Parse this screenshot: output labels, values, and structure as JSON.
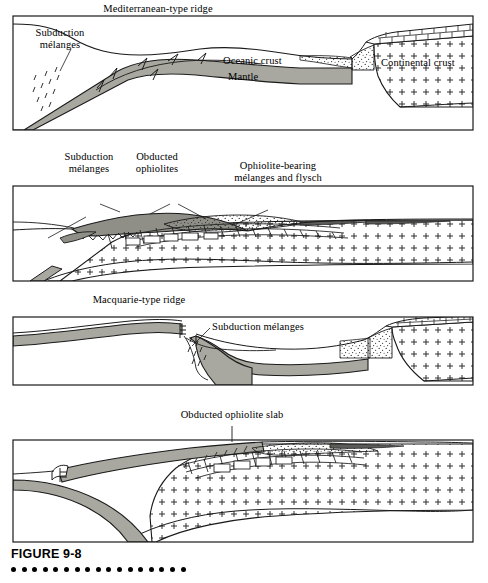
{
  "figure": {
    "caption": "FIGURE 9-8",
    "dot_count": 17,
    "dot_color": "#000000"
  },
  "colors": {
    "outline": "#1a1a1a",
    "oceanic_crust_fill": "#a8a8a0",
    "melange_fill": "#8f8f88",
    "flysch_fill": "#e8e8e2",
    "continental_fill": "#ffffff",
    "background": "#ffffff"
  },
  "panels": [
    {
      "id": "panel-1",
      "stage": 1,
      "title": "Mediterranean-type ridge",
      "labels": [
        {
          "name": "ridge-label",
          "text": "Mediterranean-type ridge",
          "x": 117,
          "y": 4,
          "leader": false
        },
        {
          "name": "subduction-melanges-label",
          "text": "Subduction\nmélanges",
          "x": 45,
          "y": 29,
          "leader": true
        },
        {
          "name": "oceanic-crust-label",
          "text": "Oceanic crust",
          "x": 228,
          "y": 55,
          "leader": false
        },
        {
          "name": "mantle-label",
          "text": "Mantle",
          "x": 229,
          "y": 71,
          "leader": false
        },
        {
          "name": "continental-crust-label",
          "text": "Continental crust",
          "x": 383,
          "y": 58,
          "leader": false
        }
      ]
    },
    {
      "id": "panel-2",
      "stage": 2,
      "title": "",
      "labels": [
        {
          "name": "subduction-melanges-label",
          "text": "Subduction\nmélanges",
          "x": 54,
          "y": 152,
          "leader": true
        },
        {
          "name": "obducted-ophiolites-label",
          "text": "Obducted\nophiolites",
          "x": 131,
          "y": 152,
          "leader": true
        },
        {
          "name": "ophiolite-bearing-melanges-label",
          "text": "Ophiolite-bearing\nmélanges and flysch",
          "x": 232,
          "y": 161,
          "leader": true
        }
      ]
    },
    {
      "id": "panel-3",
      "stage": 3,
      "title": "Macquarie-type ridge",
      "labels": [
        {
          "name": "ridge-label",
          "text": "Macquarie-type ridge",
          "x": 115,
          "y": 295,
          "leader": false
        },
        {
          "name": "subduction-melanges-label",
          "text": "Subduction mélanges",
          "x": 214,
          "y": 322,
          "leader": true
        }
      ]
    },
    {
      "id": "panel-4",
      "stage": 4,
      "title": "Obducted ophiolite slab",
      "labels": [
        {
          "name": "obducted-ophiolite-slab-label",
          "text": "Obducted ophiolite slab",
          "x": 186,
          "y": 411,
          "leader": true
        }
      ]
    }
  ],
  "legend_patterns": {
    "continental_crust": "plus-sign stipple",
    "sedimentary_cover": "brick / rectangular blocks",
    "flysch": "fine random stipple",
    "oceanic_crust": "solid gray band",
    "melange": "darker gray with sawtooth upper contact",
    "fault_ticks": "short paired tick marks"
  }
}
